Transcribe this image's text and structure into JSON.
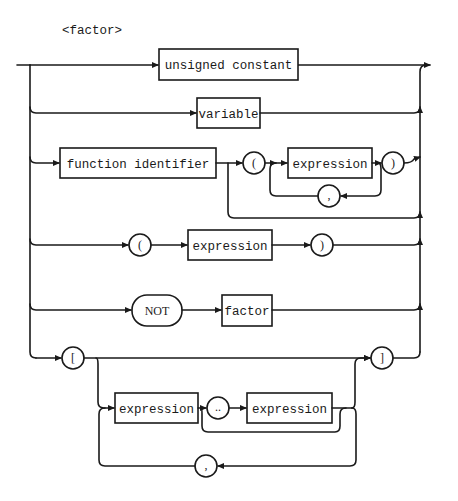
{
  "diagram": {
    "title": "<factor>",
    "kind": "syntax-diagram",
    "alternatives": [
      {
        "id": "unsigned-constant",
        "elements": [
          {
            "type": "nonterminal",
            "label": "unsigned constant"
          }
        ]
      },
      {
        "id": "variable",
        "elements": [
          {
            "type": "nonterminal",
            "label": "variable"
          }
        ]
      },
      {
        "id": "function-call",
        "elements": [
          {
            "type": "nonterminal",
            "label": "function identifier"
          },
          {
            "type": "terminal",
            "label": "("
          },
          {
            "type": "nonterminal",
            "label": "expression"
          },
          {
            "type": "terminal",
            "label": ")"
          },
          {
            "type": "terminal",
            "label": ",",
            "role": "loop-separator"
          }
        ],
        "optional_args": true
      },
      {
        "id": "parenthesized",
        "elements": [
          {
            "type": "terminal",
            "label": "("
          },
          {
            "type": "nonterminal",
            "label": "expression"
          },
          {
            "type": "terminal",
            "label": ")"
          }
        ]
      },
      {
        "id": "not-factor",
        "elements": [
          {
            "type": "terminal",
            "label": "NOT"
          },
          {
            "type": "nonterminal",
            "label": "factor"
          }
        ]
      },
      {
        "id": "set",
        "elements": [
          {
            "type": "terminal",
            "label": "["
          },
          {
            "type": "nonterminal",
            "label": "expression"
          },
          {
            "type": "terminal",
            "label": ".."
          },
          {
            "type": "nonterminal",
            "label": "expression"
          },
          {
            "type": "terminal",
            "label": ",",
            "role": "loop-separator"
          },
          {
            "type": "terminal",
            "label": "]"
          }
        ]
      }
    ]
  },
  "labels": {
    "unsigned_constant": "unsigned constant",
    "variable": "variable",
    "function_identifier": "function identifier",
    "lparen": "(",
    "rparen": ")",
    "expression": "expression",
    "comma": ",",
    "not": "NOT",
    "factor": "factor",
    "lbracket": "[",
    "rbracket": "]",
    "range": ".."
  }
}
